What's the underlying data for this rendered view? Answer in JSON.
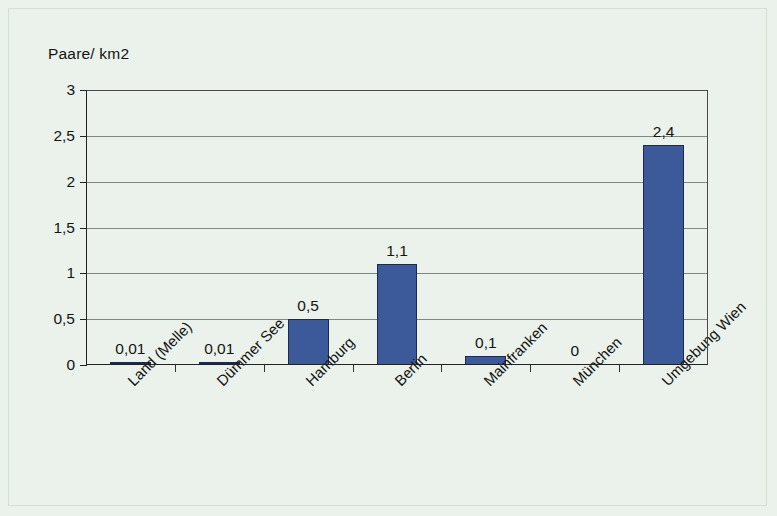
{
  "chart_data": {
    "type": "bar",
    "title": "",
    "subtitle": "",
    "xlabel": "",
    "ylabel": "Paare/ km2",
    "ylim": [
      0,
      3
    ],
    "ytick_labels": [
      "0",
      "0,5",
      "1",
      "1,5",
      "2",
      "2,5",
      "3"
    ],
    "ytick_values": [
      0,
      0.5,
      1,
      1.5,
      2,
      2.5,
      3
    ],
    "grid": "horizontal",
    "legend": "none",
    "categories": [
      "Land (Melle)",
      "Dümmer See",
      "Hamburg",
      "Berlin",
      "Mainfranken",
      "München",
      "Umgebung Wien"
    ],
    "values": [
      0.01,
      0.01,
      0.5,
      1.1,
      0.1,
      0,
      2.4
    ],
    "value_labels": [
      "0,01",
      "0,01",
      "0,5",
      "1,1",
      "0,1",
      "0",
      "2,4"
    ],
    "bar_color": "#3c5a9a",
    "bar_border_color": "#1b2a52",
    "background_color": "#eaf2eb",
    "gridline_color": "#7d8b7e",
    "axis_color": "#222222",
    "text_color": "#141414"
  }
}
